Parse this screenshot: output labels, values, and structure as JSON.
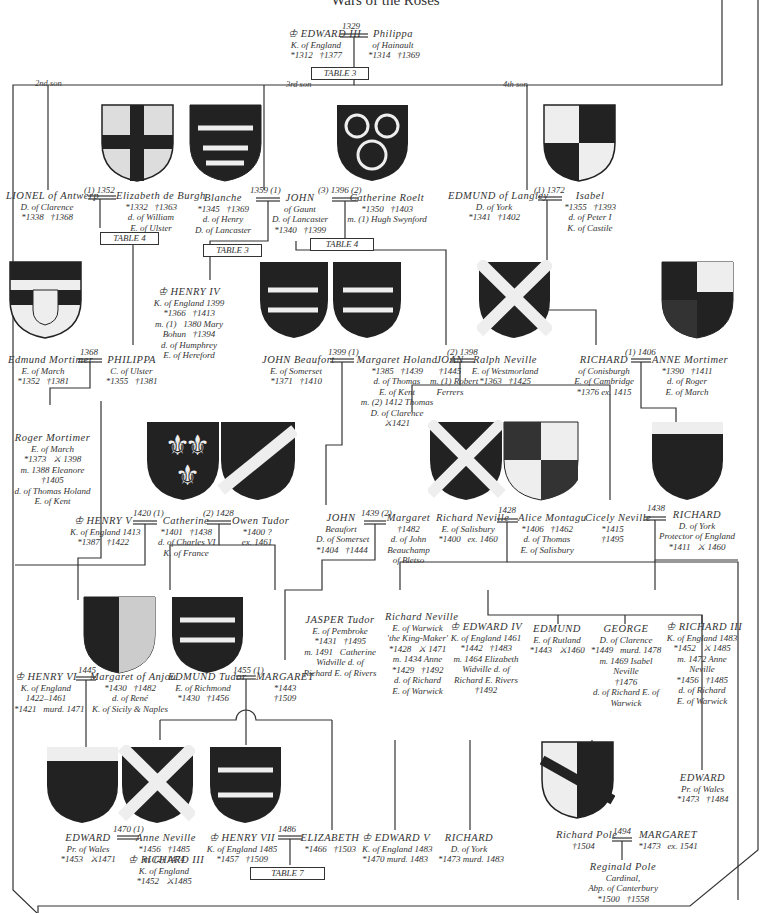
{
  "title": "Wars of the Roses",
  "labels": {
    "son2": "2nd son",
    "son3": "3rd son",
    "son4": "4th son"
  },
  "tables": {
    "t3a": "TABLE 3",
    "t4a": "TABLE 4",
    "t3b": "TABLE 3",
    "t4b": "TABLE 4",
    "t7": "TABLE 7"
  },
  "marriages": {
    "edward3": "1329",
    "lionel": "(1) 1352",
    "gaunt1": "1359 (1)",
    "gaunt3": "(3) 1396 (2)",
    "langley": "(1) 1372",
    "mortimer": "1368",
    "beaufort": "1399 (1)",
    "joan": "(2) 1398",
    "cambridge": "(1) 1406",
    "henry5": "1420 (1)",
    "tudor": "(2) 1428",
    "beaufort2": "1439 (2)",
    "salisbury": "1428",
    "york": "1438",
    "henry6": "1445",
    "richmond": "1455 (1)",
    "edwardpw": "1470 (1)",
    "henry7": "1486",
    "pole": "1494"
  },
  "people": {
    "edward3": {
      "name": "♔ EDWARD III",
      "lines": "K. of England\n*1312   †1377"
    },
    "philippa": {
      "name": "Philippa",
      "lines": "of Hainault\n*1314   †1369"
    },
    "lionel": {
      "name": "LIONEL of Antwerp",
      "lines": "D. of Clarence\n*1338   †1368"
    },
    "elizabeth_burgh": {
      "name": "Elizabeth de Burgh",
      "lines": "*1332   †1363\nd. of William\nE. of Ulster"
    },
    "blanche": {
      "name": "Blanche",
      "lines": "*1345   †1369\nd. of Henry\nD. of Lancaster"
    },
    "john_gaunt": {
      "name": "JOHN",
      "lines": "of Gaunt\nD. of Lancaster\n*1340   †1399"
    },
    "catherine_roelt": {
      "name": "Catherine Roelt",
      "lines": "*1350   †1403\nm. (1) Hugh Swynford"
    },
    "edmund_langley": {
      "name": "EDMUND of Langley",
      "lines": "D. of York\n*1341   †1402"
    },
    "isabel": {
      "name": "Isabel",
      "lines": "*1355   †1393\nd. of Peter I\nK. of Castile"
    },
    "henry4": {
      "name": "♔ HENRY IV",
      "lines": "K. of England 1399\n*1366   †1413\nm. (1)   1380 Mary\nBohun   †1394\nd. of Humphrey\nE. of Hereford"
    },
    "edmund_mortimer": {
      "name": "Edmund Mortimer",
      "lines": "E. of March\n*1352   †1381"
    },
    "philippa_ulster": {
      "name": "PHILIPPA",
      "lines": "C. of Ulster\n*1355   †1381"
    },
    "john_beaufort": {
      "name": "JOHN Beaufort",
      "lines": "E. of Somerset\n*1371   †1410"
    },
    "margaret_holand": {
      "name": "Margaret Holand",
      "lines": "*1385   †1439\nd. of Thomas\nE. of Kent\nm. (2) 1412 Thomas\nD. of Clarence\n⚔1421"
    },
    "joan": {
      "name": "JOAN",
      "lines": "†1445\nm. (1) Robert\nFerrers"
    },
    "ralph_neville": {
      "name": "Ralph Neville",
      "lines": "E. of Westmorland\n*1363   †1425"
    },
    "richard_conisburgh": {
      "name": "RICHARD",
      "lines": "of Conisburgh\nE. of Cambridge\n*1376 ex. 1415"
    },
    "anne_mortimer": {
      "name": "ANNE Mortimer",
      "lines": "*1390   †1411\nd. of Roger\nE. of March"
    },
    "roger_mortimer": {
      "name": "Roger Mortimer",
      "lines": "E. of March\n*1373   ⚔ 1398\nm. 1388 Eleanore\n†1405\nd. of Thomas Holand\nE. of Kent"
    },
    "henry5": {
      "name": "♔ HENRY V",
      "lines": "K. of England 1413\n*1387   †1422"
    },
    "catherine_valois": {
      "name": "Catherine",
      "lines": "*1401   †1438\nd. of Charles VI\nK. of France"
    },
    "owen_tudor": {
      "name": "Owen Tudor",
      "lines": "*1400 ?\nex. 1461"
    },
    "john_beaufort2": {
      "name": "JOHN",
      "lines": "Beaufort\nD. of Somerset\n*1404   †1444"
    },
    "margaret_beauchamp": {
      "name": "Margaret",
      "lines": "†1482\nd. of John\nBeauchamp\nof Bletso"
    },
    "richard_salisbury": {
      "name": "Richard Neville",
      "lines": "E. of Salisbury\n*1400   ex. 1460"
    },
    "alice_montagu": {
      "name": "Alice Montagu",
      "lines": "*1406   †1462\nd. of Thomas\nE. of Salisbury"
    },
    "cicely": {
      "name": "Cicely Neville",
      "lines": "*1415\n†1495"
    },
    "richard_york": {
      "name": "RICHARD",
      "lines": "D. of York\nProtector of England\n*1411   ⚔ 1460"
    },
    "jasper": {
      "name": "JASPER Tudor",
      "lines": "E. of Pembroke\n*1431   †1495\nm. 1491   Catherine\nWidville d. of\nRichard E. of Rivers"
    },
    "warwick": {
      "name": "Richard Neville",
      "lines": "E. of Warwick\n'the King-Maker'\n*1428   ⚔ 1471\nm. 1434 Anne\n*1429   †1492\nd. of Richard\nE. of Warwick"
    },
    "edward4": {
      "name": "♔ EDWARD IV",
      "lines": "K. of England 1461\n*1442   †1483\nm. 1464 Elizabeth\nWidville d. of\nRichard E. Rivers\n†1492"
    },
    "edmund_rutland": {
      "name": "EDMUND",
      "lines": "E. of Rutland\n*1443   ⚔1460"
    },
    "george": {
      "name": "GEORGE",
      "lines": "D. of Clarence\n*1449   murd. 1478\nm. 1469 Isabel\nNeville\n†1476\nd. of Richard E. of\nWarwick"
    },
    "richard3": {
      "name": "♔ RICHARD III",
      "lines": "K. of England 1483\n*1452   ⚔ 1485\nm. 1472 Anne\nNeville\n*1456   †1485\nd. of Richard\nE. of Warwick"
    },
    "henry6": {
      "name": "♔ HENRY VI",
      "lines": "K. of England\n1422–1461\n*1421   murd. 1471"
    },
    "margaret_anjou": {
      "name": "Margaret of Anjou",
      "lines": "*1430   †1482\nd. of René\nK. of Sicily & Naples"
    },
    "edmund_tudor": {
      "name": "EDMUND Tudor",
      "lines": "E. of Richmond\n*1430   †1456"
    },
    "margaret_beaufort": {
      "name": "MARGARET",
      "lines": "*1443\n†1509"
    },
    "edward_pw1": {
      "name": "EDWARD",
      "lines": "Pr. of Wales\n*1453   ⚔1471"
    },
    "anne_neville": {
      "name": "Anne Neville",
      "lines": "*1456   †1485\nm. (2) 1474"
    },
    "richard3b": {
      "name": "♔ RICHARD III",
      "lines": "K. of England\n*1452   ⚔1485"
    },
    "henry7": {
      "name": "♔ HENRY VII",
      "lines": "K. of England 1485\n*1457   †1509"
    },
    "elizabeth_york": {
      "name": "ELIZABETH",
      "lines": "*1466   †1503"
    },
    "edward5": {
      "name": "♔ EDWARD V",
      "lines": "K. of England 1483\n*1470 murd. 1483"
    },
    "richard_shrewsbury": {
      "name": "RICHARD",
      "lines": "D. of York\n*1473 murd. 1483"
    },
    "edward_pw2": {
      "name": "EDWARD",
      "lines": "Pr. of Wales\n*1473   †1484"
    },
    "richard_pole": {
      "name": "Richard Pole",
      "lines": "†1504"
    },
    "margaret_pole": {
      "name": "MARGARET",
      "lines": "*1473   ex. 1541"
    },
    "reginald_pole": {
      "name": "Reginald Pole",
      "lines": "Cardinal,\nAbp. of Canterbury\n*1500   †1558"
    }
  }
}
